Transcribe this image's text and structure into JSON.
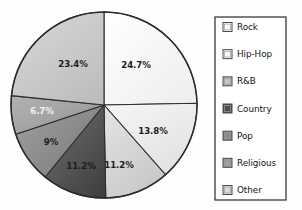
{
  "chart_data": {
    "type": "pie",
    "title": "",
    "subtitle": "",
    "xlabel": "",
    "ylabel": "",
    "grid": false,
    "legend_position": "right",
    "start_angle_deg": 0,
    "direction": "clockwise",
    "categories": [
      "Rock",
      "Hip-Hop",
      "R&B",
      "Country",
      "Pop",
      "Religious",
      "Other"
    ],
    "values": [
      24.7,
      13.8,
      11.2,
      11.2,
      9.0,
      6.7,
      23.4
    ],
    "value_labels": [
      "24.7%",
      "13.8%",
      "11.2%",
      "11.2%",
      "9%",
      "6.7%",
      "23.4%"
    ],
    "colors": [
      "#f7f7f7",
      "#ededed",
      "#d8d8d8",
      "#585858",
      "#8e8e8e",
      "#a8a8a8",
      "#c9c9c9"
    ],
    "label_text_colors": [
      "dark",
      "dark",
      "dark",
      "dark",
      "dark",
      "light",
      "dark"
    ],
    "units": "percent",
    "total": 100.0
  },
  "pie": {
    "center_x": 104,
    "center_y": 105,
    "radius": 93,
    "slices": [
      {
        "name": "Rock",
        "label": "24.7%",
        "value": 24.7,
        "color": "#f7f7f7",
        "label_color": "dark",
        "label_x": 136,
        "label_y": 65
      },
      {
        "name": "Hip-Hop",
        "label": "13.8%",
        "value": 13.8,
        "color": "#ededed",
        "label_color": "dark",
        "label_x": 153,
        "label_y": 131
      },
      {
        "name": "R&B",
        "label": "11.2%",
        "value": 11.2,
        "color": "#d8d8d8",
        "label_color": "dark",
        "label_x": 119,
        "label_y": 165
      },
      {
        "name": "Country",
        "label": "11.2%",
        "value": 11.2,
        "color": "#585858",
        "label_color": "dark",
        "label_x": 81,
        "label_y": 166
      },
      {
        "name": "Pop",
        "label": "9%",
        "value": 9.0,
        "color": "#8e8e8e",
        "label_color": "dark",
        "label_x": 51,
        "label_y": 142
      },
      {
        "name": "Religious",
        "label": "6.7%",
        "value": 6.7,
        "color": "#a8a8a8",
        "label_color": "light",
        "label_x": 42,
        "label_y": 111
      },
      {
        "name": "Other",
        "label": "23.4%",
        "value": 23.4,
        "color": "#c9c9c9",
        "label_color": "dark",
        "label_x": 73,
        "label_y": 64
      }
    ]
  },
  "legend": {
    "box": {
      "x": 215,
      "y": 17,
      "width": 71,
      "height": 183
    },
    "items": [
      {
        "label": "Rock",
        "swatch": "#ffffff",
        "swatch_name": "legend-swatch-rock"
      },
      {
        "label": "Hip-Hop",
        "swatch": "#fafafa",
        "swatch_name": "legend-swatch-hip-hop"
      },
      {
        "label": "R&B",
        "swatch": "#c4c4c4",
        "swatch_name": "legend-swatch-rnb"
      },
      {
        "label": "Country",
        "swatch": "#4f4f4f",
        "swatch_name": "legend-swatch-country"
      },
      {
        "label": "Pop",
        "swatch": "#8a8a8a",
        "swatch_name": "legend-swatch-pop"
      },
      {
        "label": "Religious",
        "swatch": "#9e9e9e",
        "swatch_name": "legend-swatch-religious"
      },
      {
        "label": "Other",
        "swatch": "#dcdcdc",
        "swatch_name": "legend-swatch-other"
      }
    ]
  },
  "colors": {
    "background": "#fefefe",
    "outline": "#2b2b2b",
    "legend_border": "#3a3a3a",
    "text": "#141414"
  }
}
